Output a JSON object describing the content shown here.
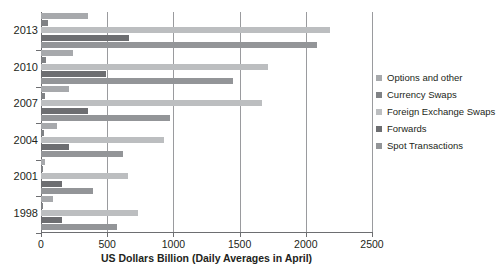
{
  "chart_data": {
    "type": "bar",
    "orientation": "horizontal",
    "title": "",
    "xlabel": "US Dollars Billion (Daily Averages in April)",
    "ylabel": "",
    "xlim": [
      0,
      2500
    ],
    "xticks": [
      0,
      500,
      1000,
      1500,
      2000,
      2500
    ],
    "xtick_labels": [
      "0",
      "500",
      "1000",
      "1500",
      "2000",
      "2500"
    ],
    "grid": true,
    "grid_axis": "x",
    "legend_position": "right",
    "categories": [
      "2013",
      "2010",
      "2007",
      "2004",
      "2001",
      "1998"
    ],
    "series": [
      {
        "name": "Options and other",
        "color": "#a7a9ac",
        "values": [
          355,
          240,
          212,
          120,
          30,
          90
        ]
      },
      {
        "name": "Currency Swaps",
        "color": "#808285",
        "values": [
          54,
          38,
          30,
          20,
          7,
          10
        ]
      },
      {
        "name": "Foreign Exchange Swaps",
        "color": "#bcbec0",
        "values": [
          2185,
          1715,
          1670,
          930,
          660,
          734
        ]
      },
      {
        "name": "Forwards",
        "color": "#6d6e71",
        "values": [
          665,
          490,
          355,
          210,
          160,
          155
        ]
      },
      {
        "name": "Spot Transactions",
        "color": "#939598",
        "values": [
          2085,
          1450,
          975,
          620,
          390,
          575
        ]
      }
    ]
  },
  "axes": {
    "x_axis_title": "US Dollars Billion (Daily Averages in April)"
  }
}
